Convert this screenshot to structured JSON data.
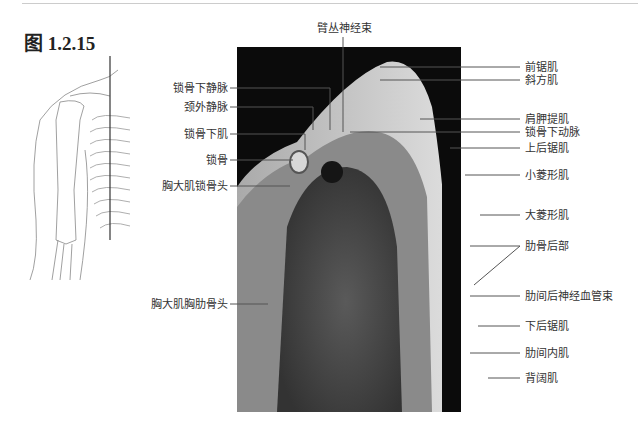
{
  "figure": {
    "title": "图 1.2.15"
  },
  "labels": {
    "top": "臂丛神经束",
    "left": [
      "锁骨下静脉",
      "颈外静脉",
      "锁骨下肌",
      "锁骨",
      "胸大肌锁骨头",
      "胸大肌胸肋骨头"
    ],
    "right": [
      "前锯肌",
      "斜方肌",
      "肩胛提肌",
      "锁骨下动脉",
      "上后锯肌",
      "小菱形肌",
      "大菱形肌",
      "肋骨后部",
      "肋间后神经血管束",
      "下后锯肌",
      "肋间内肌",
      "背阔肌"
    ]
  },
  "images": {
    "sketch": "shoulder-skeleton-line-drawing",
    "mri": "sagittal-mri-shoulder-chest"
  }
}
